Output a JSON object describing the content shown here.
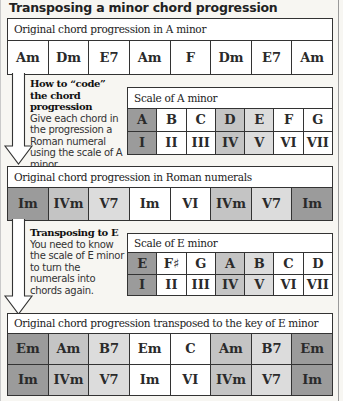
{
  "title": "Transposing a minor chord progression",
  "colors": {
    "dark": "#9b9b9b",
    "mid": "#c4c4c4",
    "light": "#dcdcdc",
    "white": "#ffffff",
    "border": "#333333"
  },
  "original": {
    "header": "Original chord progression in A minor",
    "chords": [
      "Am",
      "Dm",
      "E7",
      "Am",
      "F",
      "Dm",
      "E7",
      "Am"
    ]
  },
  "step1": {
    "heading": "How to “code” the chord progression",
    "text": "Give each chord in the progression a Roman numeral using the scale of A minor."
  },
  "scale_a": {
    "header": "Scale of A minor",
    "notes": [
      "A",
      "B",
      "C",
      "D",
      "E",
      "F",
      "G"
    ],
    "numerals": [
      "I",
      "II",
      "III",
      "IV",
      "V",
      "VI",
      "VII"
    ],
    "shades": [
      "dark",
      "white",
      "white",
      "mid",
      "light",
      "white",
      "white"
    ]
  },
  "roman": {
    "header": "Original chord progression in Roman numerals",
    "numerals": [
      "Im",
      "IVm",
      "V7",
      "Im",
      "VI",
      "IVm",
      "V7",
      "Im"
    ],
    "shades": [
      "dark",
      "mid",
      "light",
      "white",
      "white",
      "mid",
      "light",
      "dark"
    ]
  },
  "step2": {
    "heading": "Transposing to E",
    "text": "You need to know the scale of E minor to turn the numerals into chords again."
  },
  "scale_e": {
    "header": "Scale of E minor",
    "notes": [
      "E",
      "F♯",
      "G",
      "A",
      "B",
      "C",
      "D"
    ],
    "numerals": [
      "I",
      "II",
      "III",
      "IV",
      "V",
      "VI",
      "VII"
    ],
    "shades": [
      "dark",
      "white",
      "white",
      "mid",
      "light",
      "white",
      "white"
    ]
  },
  "transposed": {
    "header": "Original chord progression transposed to the key of E minor",
    "chords": [
      "Em",
      "Am",
      "B7",
      "Em",
      "C",
      "Am",
      "B7",
      "Em"
    ],
    "numerals": [
      "Im",
      "IVm",
      "V7",
      "Im",
      "VI",
      "IVm",
      "V7",
      "Im"
    ],
    "shades": [
      "dark",
      "mid",
      "light",
      "white",
      "white",
      "mid",
      "light",
      "dark"
    ]
  }
}
